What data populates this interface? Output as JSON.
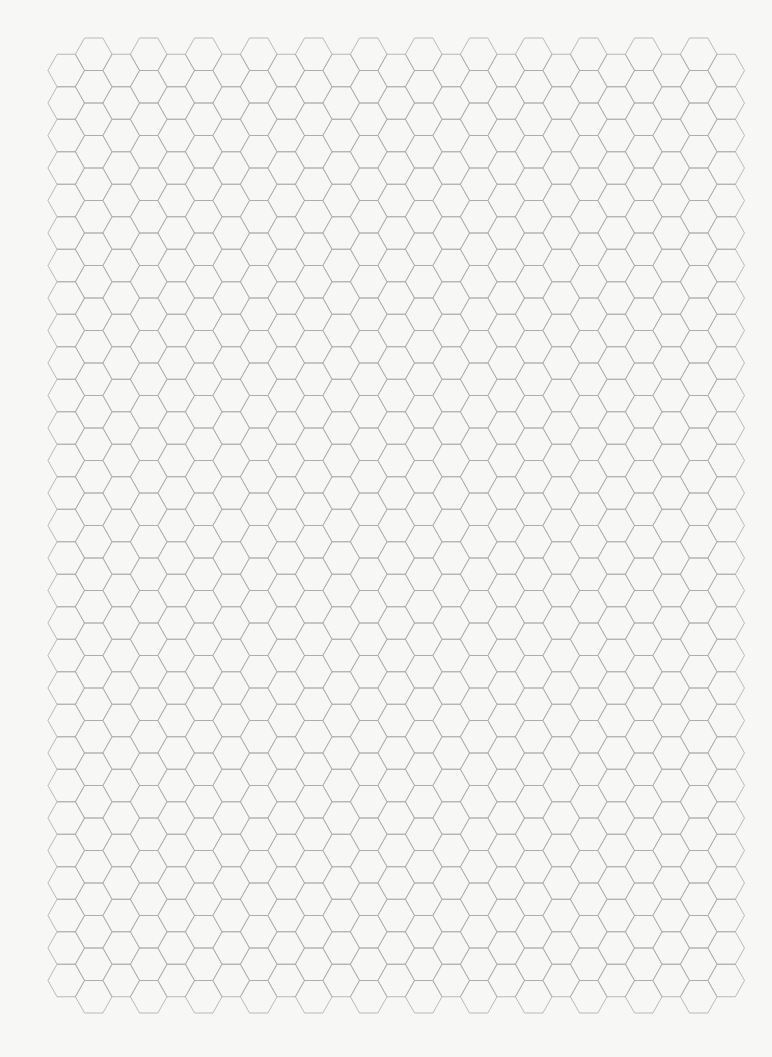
{
  "page": {
    "title": "Hexagonal graph paper",
    "background_color": "#f7f7f6",
    "width": 772,
    "height": 1057
  },
  "grid": {
    "orientation": "flat-top",
    "line_color": "#a9a9a9",
    "line_width": 0.8,
    "first_column_center_x": 66.2,
    "column_spacing_x": 27.5,
    "columns": 25,
    "hex_half_width": 18.3,
    "hex_height": 32.5,
    "top_of_raised_columns_y": 38,
    "raised_columns_hex_count": 30,
    "lowered_columns_hex_count": 29,
    "first_column_is_raised": false
  }
}
